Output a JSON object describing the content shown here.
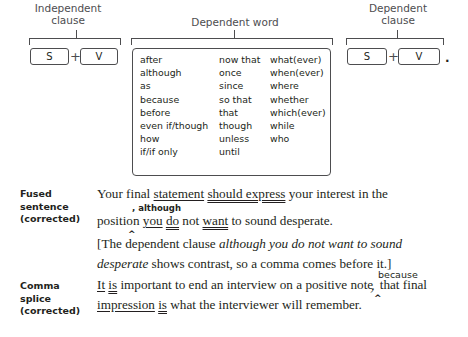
{
  "diagram": {
    "independent_clause": {
      "label_line1": "Independent",
      "label_line2": "clause",
      "subject": "S",
      "plus": "+",
      "verb": "V"
    },
    "dependent_word": {
      "label": "Dependent word",
      "columns": [
        [
          "after",
          "although",
          "as",
          "because",
          "before",
          "even if/though",
          "how",
          "if/if only"
        ],
        [
          "now that",
          "once",
          "since",
          "so that",
          "that",
          "though",
          "unless",
          "until"
        ],
        [
          "what(ever)",
          "when(ever)",
          "where",
          "whether",
          "which(ever)",
          "while",
          "who"
        ]
      ]
    },
    "dependent_clause": {
      "label_line1": "Dependent",
      "label_line2": "clause",
      "subject": "S",
      "plus": "+",
      "verb": "V",
      "end_mark": "."
    }
  },
  "examples": [
    {
      "label_lines": [
        "Fused",
        "sentence",
        "(corrected)"
      ],
      "insertion": ", although",
      "caret": "^",
      "line1": {
        "t1": "Your final ",
        "statement": "statement",
        "t2": " ",
        "should_express": "should express",
        "t3": " your interest in the"
      },
      "line2": {
        "t1": "position ",
        "you": "you",
        "t2": " ",
        "do": "do",
        "t3": " not ",
        "want": "want",
        "t4": " to sound desperate."
      },
      "note": {
        "t1": "[The dependent clause ",
        "italic1": "although you do not want to sound",
        "italic2": "desperate",
        "t2": " shows contrast, so a comma comes before it.]"
      }
    },
    {
      "label_lines": [
        "Comma",
        "splice",
        "(corrected)"
      ],
      "insertion": "because",
      "caret": "^",
      "line1": {
        "it": "It",
        "t1": " ",
        "is": "is",
        "t2": " important to end an interview on a positive note",
        "struck_comma": ",",
        "t3": " that final"
      },
      "line2": {
        "impression": "impression",
        "t1": " ",
        "is": "is",
        "t2": " what the interviewer will remember."
      }
    }
  ]
}
